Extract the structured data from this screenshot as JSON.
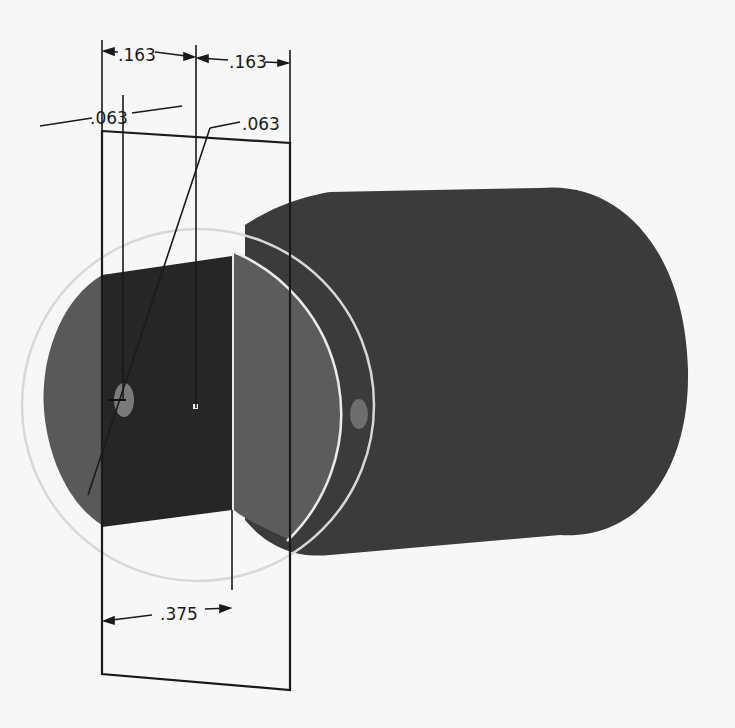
{
  "drawing": {
    "description": "Isometric CAD view of a cylindrical shaft with a sketch plane and dimensions",
    "colors": {
      "background": "#f7f7f7",
      "body_main": "#3b3b3b",
      "body_end_face": "#5a5a5a",
      "section_face": "#262626",
      "hole": "#7a7a7a",
      "sketch_lines": "#1a1a1a",
      "projection_circle": "#d6d6d6",
      "edge_highlight": "#e8e8e8"
    },
    "dimensions": {
      "top_left": ".163",
      "top_right": ".163",
      "hole_offset_left": ".063",
      "hole_diameter": ".063",
      "bottom_length": ".375"
    }
  }
}
